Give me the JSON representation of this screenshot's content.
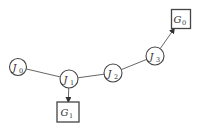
{
  "diagram": {
    "nodes": [
      {
        "id": "J0",
        "shape": "circle",
        "label": "J",
        "subscript": "0"
      },
      {
        "id": "J1",
        "shape": "circle",
        "label": "J",
        "subscript": "1"
      },
      {
        "id": "J2",
        "shape": "circle",
        "label": "J",
        "subscript": "2"
      },
      {
        "id": "J3",
        "shape": "circle",
        "label": "J",
        "subscript": "3"
      },
      {
        "id": "G0",
        "shape": "box",
        "label": "G",
        "subscript": "0"
      },
      {
        "id": "G1",
        "shape": "box",
        "label": "G",
        "subscript": "1"
      }
    ],
    "edges": [
      {
        "from": "J0",
        "to": "J1",
        "directed": false
      },
      {
        "from": "J1",
        "to": "J2",
        "directed": false
      },
      {
        "from": "J2",
        "to": "J3",
        "directed": false
      },
      {
        "from": "J1",
        "to": "G1",
        "directed": true
      },
      {
        "from": "J3",
        "to": "G0",
        "directed": true
      }
    ]
  }
}
